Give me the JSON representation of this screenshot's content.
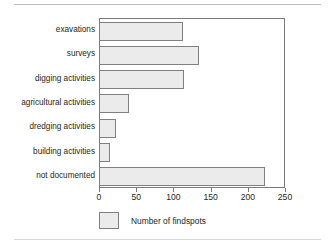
{
  "chart_data": {
    "type": "bar",
    "orientation": "horizontal",
    "title": "",
    "subtitle": "",
    "xlabel": "",
    "ylabel": "",
    "categories": [
      "exavations",
      "surveys",
      "digging activities",
      "agricultural activities",
      "dredging activities",
      "building activities",
      "not documented"
    ],
    "values": [
      111,
      133,
      113,
      39,
      21,
      13,
      222
    ],
    "series": [
      {
        "name": "Number of findspots",
        "values": [
          111,
          133,
          113,
          39,
          21,
          13,
          222
        ]
      }
    ],
    "xlim": [
      0,
      250
    ],
    "xticks": [
      0,
      50,
      100,
      150,
      200,
      250
    ],
    "xtick_labels": [
      "0",
      "50",
      "100",
      "150",
      "200",
      "250"
    ],
    "grid": false,
    "legend": {
      "position": "bottom-left",
      "entries": [
        "Number of findspots"
      ]
    },
    "colors": {
      "bar_fill": "#ebebeb",
      "bar_border": "#808080",
      "axis": "#7a7a7a",
      "text": "#231f20",
      "background": "#ffffff"
    }
  }
}
